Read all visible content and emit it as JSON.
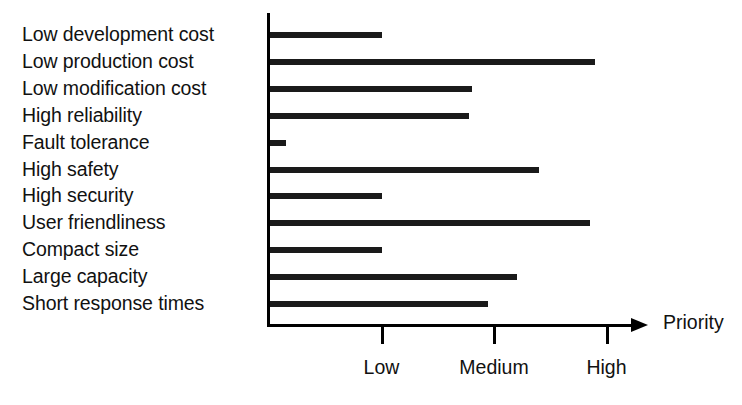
{
  "chart_data": {
    "type": "bar",
    "orientation": "horizontal",
    "title": "",
    "xlabel": "Priority",
    "ylabel": "",
    "grid": false,
    "legend": null,
    "xlim": [
      0,
      3.5
    ],
    "x_tick_labels": [
      "Low",
      "Medium",
      "High"
    ],
    "x_tick_values": [
      1,
      2,
      3
    ],
    "categories": [
      "Low development cost",
      "Low production cost",
      "Low modification cost",
      "High reliability",
      "Fault tolerance",
      "High safety",
      "High security",
      "User friendliness",
      "Compact size",
      "Large capacity",
      "Short response times"
    ],
    "values": [
      1.0,
      2.9,
      1.8,
      1.78,
      0.15,
      2.4,
      1.0,
      2.85,
      1.0,
      2.2,
      1.95
    ],
    "bars": [
      {
        "label": "Low development cost",
        "value": 1.0
      },
      {
        "label": "Low production cost",
        "value": 2.9
      },
      {
        "label": "Low modification cost",
        "value": 1.8
      },
      {
        "label": "High reliability",
        "value": 1.78
      },
      {
        "label": "Fault tolerance",
        "value": 0.15
      },
      {
        "label": "High safety",
        "value": 2.4
      },
      {
        "label": "High security",
        "value": 1.0
      },
      {
        "label": "User friendliness",
        "value": 2.85
      },
      {
        "label": "Compact size",
        "value": 1.0
      },
      {
        "label": "Large capacity",
        "value": 2.2
      },
      {
        "label": "Short response times",
        "value": 1.95
      }
    ],
    "colors": {
      "bar": "#1a1a1a",
      "axis": "#000000",
      "text": "#111111",
      "background": "#ffffff"
    }
  },
  "axis": {
    "x_title": "Priority",
    "ticks": [
      {
        "label": "Low",
        "value": 1
      },
      {
        "label": "Medium",
        "value": 2
      },
      {
        "label": "High",
        "value": 3
      }
    ]
  }
}
